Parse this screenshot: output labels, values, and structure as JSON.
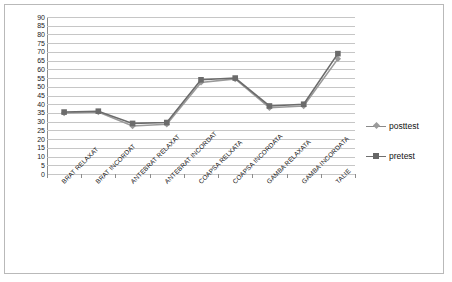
{
  "chart_data": {
    "type": "line",
    "title": "",
    "xlabel": "",
    "ylabel": "",
    "ylim": [
      0,
      90
    ],
    "ytick_step": 5,
    "yticks": [
      90,
      85,
      80,
      75,
      70,
      65,
      60,
      55,
      50,
      45,
      40,
      35,
      30,
      25,
      20,
      15,
      10,
      5,
      0
    ],
    "grid": true,
    "legend_position": "right",
    "categories": [
      "BRAT RELAXAT",
      "BRAT INCORDAT",
      "ANTEBRAT RELAXAT",
      "ANTEBRAT INCORDAT",
      "COAPSA RELXATA",
      "COAPSA INCORDATA",
      "GAMBA RELAXATA",
      "GAMBA INCORDATA",
      "TALIE"
    ],
    "series": [
      {
        "name": "posttest",
        "marker": "diamond",
        "color": "#9a9a9a",
        "values": [
          35,
          35.5,
          27.5,
          28.5,
          52.5,
          54.5,
          38,
          39,
          66
        ]
      },
      {
        "name": "pretest",
        "marker": "square",
        "color": "#6b6b6b",
        "values": [
          35.5,
          36,
          29,
          29.5,
          54,
          55,
          39,
          40,
          69
        ]
      }
    ]
  },
  "legend": {
    "items": [
      {
        "label": "posttest"
      },
      {
        "label": "pretest"
      }
    ]
  },
  "axis": {
    "y_labels": [
      "90",
      "85",
      "80",
      "75",
      "70",
      "65",
      "60",
      "55",
      "50",
      "45",
      "40",
      "35",
      "30",
      "25",
      "20",
      "15",
      "10",
      "5",
      "0"
    ]
  },
  "colors": {
    "posttest": "#9a9a9a",
    "pretest": "#6b6b6b",
    "gridline": "#c6c6c6",
    "axis": "#8d8d8d",
    "border": "#b9b9b9",
    "text": "#151515"
  }
}
